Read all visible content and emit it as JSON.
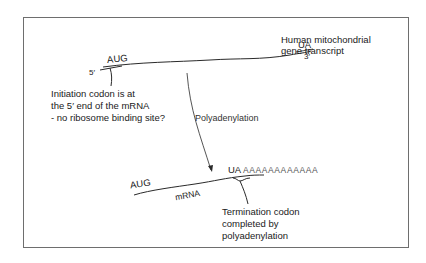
{
  "diagram": {
    "top_transcript": {
      "label_line1": "Human mitochondrial",
      "label_line2": "gene transcript",
      "start_codon": "AUG",
      "end_partial_codon": "UA",
      "five_prime": "5′",
      "three_prime": "3′"
    },
    "initiation_note": {
      "line1": "Initiation codon is at",
      "line2": "the 5′ end of the mRNA",
      "line3": "- no ribosome binding site?"
    },
    "process_arrow": {
      "label": "Polyadenylation"
    },
    "bottom_transcript": {
      "start_codon": "AUG",
      "molecule_label": "mRNA",
      "stop_partial": "UA",
      "poly_a_tail": "AAAAAAAAAAAA"
    },
    "termination_note": {
      "line1": "Termination codon",
      "line2": "completed by",
      "line3": "polyadenylation"
    },
    "colors": {
      "line": "#2a2a2a",
      "frame": "#6e6e6e",
      "text": "#1a1a1a",
      "tail_text": "#555555"
    }
  }
}
